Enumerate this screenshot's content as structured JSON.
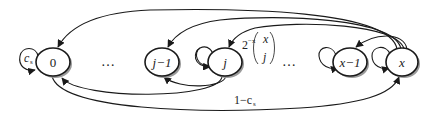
{
  "diagram": {
    "type": "markov-chain",
    "nodes": [
      {
        "id": "0",
        "label": "0"
      },
      {
        "id": "j-1",
        "label": "j−1"
      },
      {
        "id": "j",
        "label": "j"
      },
      {
        "id": "x-1",
        "label": "x−1"
      },
      {
        "id": "x",
        "label": "x"
      }
    ],
    "ellipses": [
      "…",
      "…"
    ],
    "edge_labels": {
      "self_loop_0": "c",
      "self_loop_0_sub": "s",
      "x_to_j_prefix": "2",
      "x_to_j_exp": "−x",
      "x_to_j_binom_top": "x",
      "x_to_j_binom_bottom": "j",
      "zero_to_x": "1−c",
      "zero_to_x_sub": "s"
    },
    "colors": {
      "stroke": "#1a1a1a",
      "shadow": "#9a9a9a",
      "fill": "#ffffff"
    }
  }
}
